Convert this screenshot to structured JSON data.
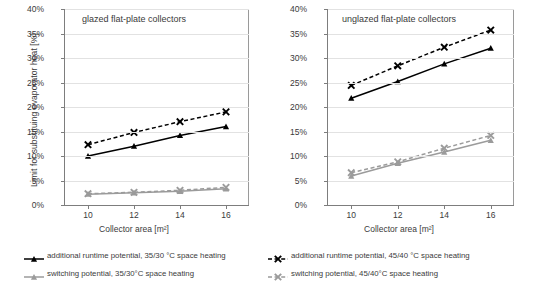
{
  "figure": {
    "ylabel": "Limit for substituing evaporator heat  [%]",
    "xlabel": "Collector area [m²]",
    "y_ticks": [
      "0%",
      "5%",
      "10%",
      "15%",
      "20%",
      "25%",
      "30%",
      "35%",
      "40%"
    ],
    "x_ticks": [
      "10",
      "12",
      "14",
      "16"
    ]
  },
  "legend": {
    "items": [
      {
        "label": "additional runtime potential, 35/30 °C space heating",
        "icon": "line-marker-triangle-solid-black",
        "color": "#000000",
        "dash": "solid",
        "marker": "triangle"
      },
      {
        "label": "additional runtime potential, 45/40 °C space heating",
        "icon": "line-marker-cross-dashed-black",
        "color": "#000000",
        "dash": "dashed",
        "marker": "cross"
      },
      {
        "label": "switching potential, 35/30°C space heating",
        "icon": "line-marker-triangle-solid-gray",
        "color": "#9b9b9b",
        "dash": "solid",
        "marker": "triangle"
      },
      {
        "label": "switching potential, 45/40°C space heating",
        "icon": "line-marker-cross-dashed-gray",
        "color": "#9b9b9b",
        "dash": "dashed",
        "marker": "cross"
      }
    ]
  },
  "chart_data": [
    {
      "type": "line",
      "title": "glazed flat-plate collectors",
      "xlabel": "Collector area [m²]",
      "ylabel": "Limit for substituing evaporator heat  [%]",
      "x": [
        10,
        12,
        14,
        16
      ],
      "xlim": [
        9,
        17
      ],
      "ylim": [
        0,
        40
      ],
      "yticks": [
        0,
        5,
        10,
        15,
        20,
        25,
        30,
        35,
        40
      ],
      "grid": true,
      "legend_position": "below-figure",
      "series": [
        {
          "name": "additional runtime potential, 35/30 °C space heating",
          "values": [
            10.0,
            12.0,
            14.2,
            16.0
          ],
          "color": "#000000",
          "dash": "solid",
          "marker": "triangle"
        },
        {
          "name": "additional runtime potential, 45/40 °C space heating",
          "values": [
            12.3,
            14.8,
            17.0,
            19.0
          ],
          "color": "#000000",
          "dash": "dashed",
          "marker": "cross"
        },
        {
          "name": "switching potential, 35/30°C space heating",
          "values": [
            2.2,
            2.5,
            2.8,
            3.3
          ],
          "color": "#9b9b9b",
          "dash": "solid",
          "marker": "triangle"
        },
        {
          "name": "switching potential, 45/40°C space heating",
          "values": [
            2.3,
            2.6,
            3.0,
            3.6
          ],
          "color": "#9b9b9b",
          "dash": "dashed",
          "marker": "cross"
        }
      ]
    },
    {
      "type": "line",
      "title": "unglazed flat-plate collectors",
      "xlabel": "Collector area [m²]",
      "ylabel": "Limit for substituing evaporator heat  [%]",
      "x": [
        10,
        12,
        14,
        16
      ],
      "xlim": [
        9,
        17
      ],
      "ylim": [
        0,
        40
      ],
      "yticks": [
        0,
        5,
        10,
        15,
        20,
        25,
        30,
        35,
        40
      ],
      "grid": true,
      "legend_position": "below-figure",
      "series": [
        {
          "name": "additional runtime potential, 35/30 °C space heating",
          "values": [
            21.8,
            25.2,
            28.8,
            32.0
          ],
          "color": "#000000",
          "dash": "solid",
          "marker": "triangle"
        },
        {
          "name": "additional runtime potential, 45/40 °C space heating",
          "values": [
            24.4,
            28.4,
            32.2,
            35.7
          ],
          "color": "#000000",
          "dash": "dashed",
          "marker": "cross"
        },
        {
          "name": "switching potential, 35/30°C space heating",
          "values": [
            5.9,
            8.5,
            10.8,
            13.2
          ],
          "color": "#9b9b9b",
          "dash": "solid",
          "marker": "triangle"
        },
        {
          "name": "switching potential, 45/40°C space heating",
          "values": [
            6.6,
            8.8,
            11.6,
            14.2
          ],
          "color": "#9b9b9b",
          "dash": "dashed",
          "marker": "cross"
        }
      ]
    }
  ]
}
